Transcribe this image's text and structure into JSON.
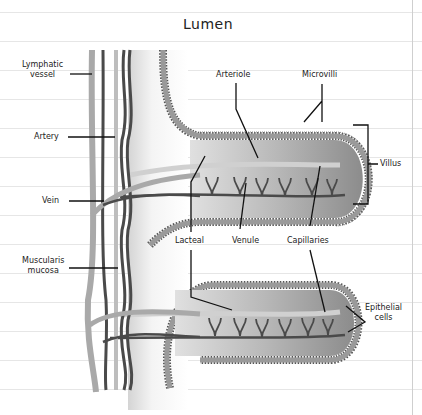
{
  "page": {
    "top_cut_text": "p          g   p",
    "title": "Lumen"
  },
  "labels": {
    "lymphatic_vessel": [
      "Lymphatic",
      "vessel"
    ],
    "artery": "Artery",
    "vein": "Vein",
    "muscularis_mucosa": [
      "Muscularis",
      "mucosa"
    ],
    "arteriole": "Arteriole",
    "microvilli": "Microvilli",
    "villus": "Villus",
    "lacteal": "Lacteal",
    "venule": "Venule",
    "capillaries": "Capillaries",
    "epithelial_cells": [
      "Epithelial",
      "cells"
    ]
  },
  "colors": {
    "ink": "#1a1a1a",
    "epithelium": "#8a8a8a",
    "epithelium_dark": "#5e5e5e",
    "villus_core": "#b4b4b4",
    "submucosa": "#e8e8e8",
    "light_vessel": "#a9a9a9",
    "dark_vessel": "#4a4a4a",
    "rule_line": "#e6e6e6"
  }
}
